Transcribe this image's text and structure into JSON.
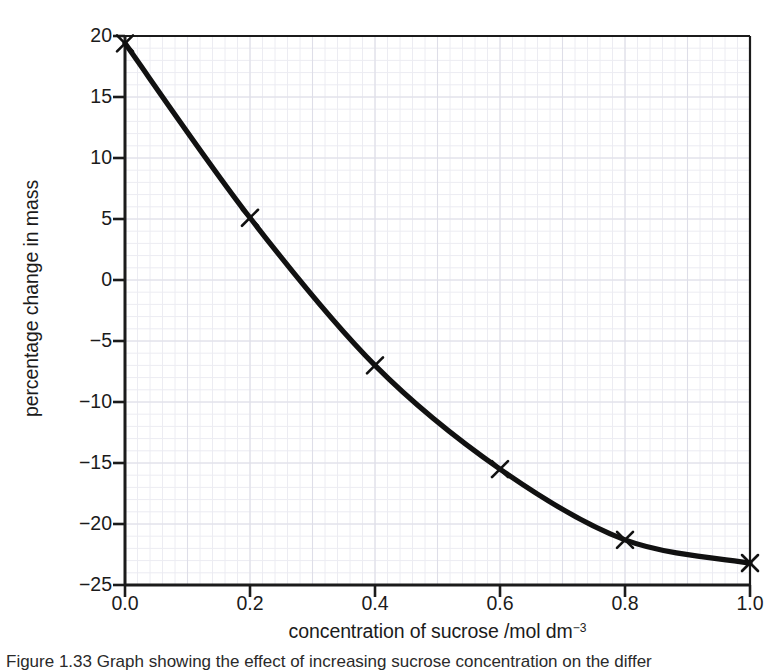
{
  "figure": {
    "caption_partial": "Figure 1.33  Graph showing the effect of increasing sucrose concentration on the differ"
  },
  "colors": {
    "line": "#111111",
    "axis": "#1b1b1b",
    "grid_minor": "#ececf2",
    "grid_major": "#dedee8",
    "background": "#ffffff",
    "text": "#1b1b1b"
  },
  "chart_data": {
    "type": "line",
    "title": "",
    "xlabel": "concentration of sucrose /mol dm",
    "xlabel_exponent": "−3",
    "ylabel": "percentage change in mass",
    "xlim": [
      0.0,
      1.0
    ],
    "ylim": [
      -25,
      20
    ],
    "grid": true,
    "grid_style": "graph-paper minor grid",
    "legend": "none",
    "marker": "x-cross",
    "x_ticks": [
      "0.0",
      "0.2",
      "0.4",
      "0.6",
      "0.8",
      "1.0"
    ],
    "x_tick_values": [
      0.0,
      0.2,
      0.4,
      0.6,
      0.8,
      1.0
    ],
    "y_ticks": [
      "20",
      "15",
      "10",
      "5",
      "0",
      "−5",
      "−10",
      "−15",
      "−20",
      "−25"
    ],
    "y_tick_values": [
      20,
      15,
      10,
      5,
      0,
      -5,
      -10,
      -15,
      -20,
      -25
    ],
    "x": [
      0.0,
      0.2,
      0.4,
      0.6,
      0.8,
      1.0
    ],
    "values": [
      19.4,
      5.1,
      -7.0,
      -15.5,
      -21.3,
      -23.2
    ],
    "series": [
      {
        "name": "percentage change in mass",
        "x": [
          0.0,
          0.2,
          0.4,
          0.6,
          0.8,
          1.0
        ],
        "values": [
          19.4,
          5.1,
          -7.0,
          -15.5,
          -21.3,
          -23.2
        ]
      }
    ]
  }
}
